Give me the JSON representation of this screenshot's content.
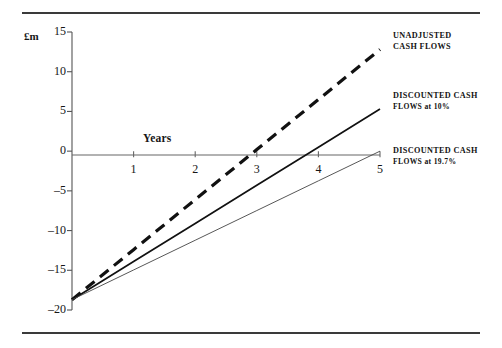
{
  "page": {
    "background": "#ffffff",
    "rule_color": "#3a3a3a"
  },
  "chart_data": {
    "type": "line",
    "title": "",
    "subtitle": "",
    "xlabel": "Years",
    "ylabel": "£m",
    "xlim": [
      0,
      5
    ],
    "ylim": [
      -20,
      15
    ],
    "xticks": [
      "1",
      "2",
      "3",
      "4",
      "5"
    ],
    "xtick_values": [
      1,
      2,
      3,
      4,
      5
    ],
    "yticks": [
      "15",
      "10",
      "5",
      "0",
      "–5",
      "–10",
      "–15",
      "–20"
    ],
    "ytick_values": [
      15,
      10,
      5,
      0,
      -5,
      -10,
      -15,
      -20
    ],
    "grid": false,
    "legend_position": "right-inline",
    "zero_line": true,
    "x": [
      0,
      1,
      2,
      3,
      4,
      5
    ],
    "series": [
      {
        "name": "UNADJUSTED CASH FLOWS",
        "label_line1": "UNADJUSTED",
        "label_line2": "CASH FLOWS",
        "style": "dashed",
        "width": 3.2,
        "color": "#111111",
        "values": [
          -18.7,
          -12.4,
          -6.1,
          0.2,
          6.5,
          12.8
        ]
      },
      {
        "name": "DISCOUNTED CASH FLOWS at 10%",
        "label_line1": "DISCOUNTED CASH",
        "label_line2": "FLOWS at 10%",
        "style": "solid",
        "width": 1.7,
        "color": "#111111",
        "values": [
          -18.7,
          -13.9,
          -9.1,
          -4.3,
          0.5,
          5.3
        ]
      },
      {
        "name": "DISCOUNTED CASH FLOWS at 19.7%",
        "label_line1": "DISCOUNTED CASH",
        "label_line2": "FLOWS at 19.7%",
        "style": "solid",
        "width": 0.9,
        "color": "#444444",
        "values": [
          -18.7,
          -14.96,
          -11.22,
          -7.48,
          -3.74,
          0.0
        ]
      }
    ]
  },
  "axis": {
    "unit_label": "£m",
    "years_label": "Years"
  }
}
